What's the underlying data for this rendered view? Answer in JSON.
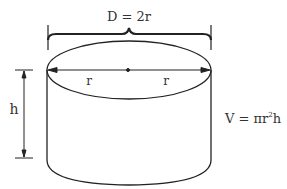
{
  "diagram": {
    "labels": {
      "diameter": "D = 2r",
      "radius_left": "r",
      "radius_right": "r",
      "height": "h",
      "formula_prefix": "V = πr",
      "formula_exp": "2",
      "formula_suffix": "h"
    },
    "colors": {
      "stroke": "#222222",
      "text": "#333333",
      "background": "#ffffff"
    }
  }
}
